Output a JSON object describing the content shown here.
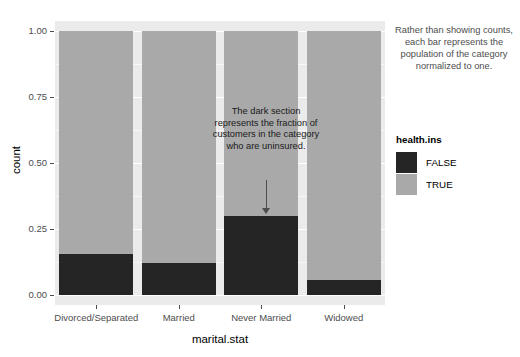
{
  "chart_data": {
    "type": "bar",
    "title": "",
    "subtitle": "",
    "xlabel": "marital.stat",
    "ylabel": "count",
    "categories": [
      "Divorced/Separated",
      "Married",
      "Never Married",
      "Widowed"
    ],
    "series": [
      {
        "name": "FALSE",
        "values": [
          0.155,
          0.12,
          0.3,
          0.055
        ],
        "color": "#252525"
      },
      {
        "name": "TRUE",
        "values": [
          0.845,
          0.88,
          0.7,
          0.945
        ],
        "color": "#a9a9a9"
      }
    ],
    "stacked": true,
    "normalized": true,
    "ylim": [
      0.0,
      1.0
    ],
    "ytick_labels": [
      "0.00",
      "0.25",
      "0.50",
      "0.75",
      "1.00"
    ],
    "ytick_values": [
      0.0,
      0.25,
      0.5,
      0.75,
      1.0
    ],
    "grid": true,
    "grid_minor": true,
    "legend_position": "right",
    "legend_title": "health.ins",
    "legend_entries": [
      "FALSE",
      "TRUE"
    ],
    "annotations": [
      {
        "name": "in-plot-note",
        "text": "The dark section represents the fraction of customers in the category who are uninsured.",
        "arrow": true,
        "points_to_category": "Never Married"
      },
      {
        "name": "side-note",
        "text": "Rather than showing counts, each bar represents the population of the category normalized to one.",
        "arrow": false
      }
    ]
  },
  "axis": {
    "y_title": "count",
    "x_title": "marital.stat",
    "y_ticks": [
      "1.00",
      "0.75",
      "0.50",
      "0.25",
      "0.00"
    ],
    "x_ticks": [
      "Divorced/Separated",
      "Married",
      "Never Married",
      "Widowed"
    ]
  },
  "legend": {
    "title": "health.ins",
    "items": [
      {
        "label": "FALSE",
        "color": "#252525"
      },
      {
        "label": "TRUE",
        "color": "#a9a9a9"
      }
    ]
  },
  "notes": {
    "side": "Rather than showing counts, each bar represents the population of the category normalized to one.",
    "in_plot": "The dark section represents the fraction of customers in the category who are uninsured."
  },
  "colors": {
    "panel_background": "#ebebeb",
    "grid_major": "#ffffff",
    "bar_false": "#252525",
    "bar_true": "#a9a9a9",
    "text": "#4d4d4d"
  }
}
